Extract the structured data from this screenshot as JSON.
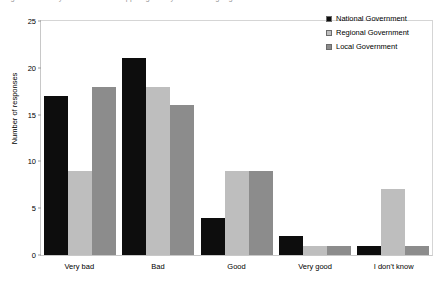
{
  "title_sliver": "Fig. How would you describe the support given by the following organisations?",
  "chart_data": {
    "type": "bar",
    "title": "",
    "xlabel": "",
    "ylabel": "Number of responses",
    "ylim": [
      0,
      25
    ],
    "yticks": [
      0,
      5,
      10,
      15,
      20,
      25
    ],
    "grid": false,
    "legend_position": "top-right",
    "categories": [
      "Very bad",
      "Bad",
      "Good",
      "Very good",
      "I don't know"
    ],
    "series": [
      {
        "name": "National Government",
        "color": "#0d0d0d",
        "values": [
          17,
          21,
          4,
          2,
          1
        ]
      },
      {
        "name": "Regional Government",
        "color": "#bebebe",
        "values": [
          9,
          18,
          9,
          1,
          7
        ]
      },
      {
        "name": "Local Government",
        "color": "#8c8c8c",
        "values": [
          18,
          16,
          9,
          1,
          1
        ]
      }
    ]
  }
}
